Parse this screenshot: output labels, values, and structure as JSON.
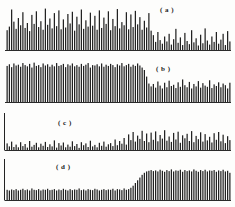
{
  "figure": {
    "background_color": "#fdfdfc",
    "bar_color": "#222222",
    "axis_color": "#222222",
    "label_a": "( a )",
    "label_b": "( b )",
    "label_c": "( c )",
    "label_d": "( d )"
  },
  "chart_data": [
    {
      "type": "bar",
      "title": "( a )",
      "xlabel": "",
      "ylabel": "",
      "grid": false,
      "legend": "none",
      "ylim": [
        0,
        100
      ],
      "axis": {
        "y_axis_visible": false,
        "baseline_visible": true
      },
      "categories": [
        "1",
        "2",
        "3",
        "4",
        "5",
        "6",
        "7",
        "8",
        "9",
        "10",
        "11",
        "12",
        "13",
        "14",
        "15",
        "16",
        "17",
        "18",
        "19",
        "20",
        "21",
        "22",
        "23",
        "24",
        "25",
        "26",
        "27",
        "28",
        "29",
        "30",
        "31",
        "32",
        "33",
        "34",
        "35",
        "36",
        "37",
        "38",
        "39",
        "40",
        "41",
        "42",
        "43",
        "44",
        "45",
        "46",
        "47",
        "48",
        "49",
        "50",
        "51",
        "52",
        "53",
        "54",
        "55",
        "56",
        "57",
        "58",
        "59",
        "60",
        "61",
        "62",
        "63",
        "64",
        "65",
        "66",
        "67",
        "68",
        "69",
        "70",
        "71",
        "72",
        "73",
        "74",
        "75",
        "76",
        "77",
        "78",
        "79",
        "80",
        "81",
        "82",
        "83",
        "84",
        "85",
        "86",
        "87",
        "88",
        "89",
        "90",
        "91",
        "92",
        "93",
        "94",
        "95",
        "96",
        "97",
        "98",
        "99",
        "100"
      ],
      "values": [
        44,
        52,
        90,
        63,
        47,
        71,
        55,
        84,
        49,
        60,
        42,
        78,
        58,
        86,
        51,
        64,
        45,
        92,
        56,
        70,
        48,
        82,
        53,
        88,
        46,
        68,
        50,
        80,
        59,
        85,
        43,
        74,
        57,
        90,
        47,
        66,
        52,
        83,
        54,
        76,
        45,
        88,
        49,
        72,
        58,
        86,
        44,
        69,
        53,
        91,
        48,
        62,
        55,
        84,
        46,
        79,
        51,
        87,
        57,
        73,
        45,
        65,
        50,
        82,
        43,
        33,
        18,
        40,
        22,
        14,
        30,
        19,
        36,
        12,
        24,
        47,
        16,
        28,
        11,
        38,
        20,
        13,
        44,
        17,
        26,
        10,
        34,
        15,
        48,
        21,
        12,
        30,
        18,
        40,
        14,
        23,
        36,
        11,
        42,
        19
      ]
    },
    {
      "type": "bar",
      "title": "( b )",
      "xlabel": "",
      "ylabel": "",
      "grid": false,
      "legend": "none",
      "ylim": [
        0,
        100
      ],
      "axis": {
        "y_axis_visible": false,
        "baseline_visible": true
      },
      "categories": [
        "1",
        "2",
        "3",
        "4",
        "5",
        "6",
        "7",
        "8",
        "9",
        "10",
        "11",
        "12",
        "13",
        "14",
        "15",
        "16",
        "17",
        "18",
        "19",
        "20",
        "21",
        "22",
        "23",
        "24",
        "25",
        "26",
        "27",
        "28",
        "29",
        "30",
        "31",
        "32",
        "33",
        "34",
        "35",
        "36",
        "37",
        "38",
        "39",
        "40",
        "41",
        "42",
        "43",
        "44",
        "45",
        "46",
        "47",
        "48",
        "49",
        "50",
        "51",
        "52",
        "53",
        "54",
        "55",
        "56",
        "57",
        "58",
        "59",
        "60",
        "61",
        "62",
        "63",
        "64",
        "65",
        "66",
        "67",
        "68",
        "69",
        "70",
        "71",
        "72",
        "73",
        "74",
        "75",
        "76",
        "77",
        "78",
        "79",
        "80",
        "81",
        "82",
        "83",
        "84",
        "85",
        "86",
        "87",
        "88",
        "89",
        "90",
        "91",
        "92",
        "93",
        "94",
        "95",
        "96",
        "97",
        "98",
        "99",
        "100"
      ],
      "values": [
        88,
        92,
        85,
        94,
        89,
        91,
        86,
        95,
        90,
        87,
        93,
        84,
        96,
        88,
        90,
        85,
        94,
        89,
        92,
        86,
        91,
        87,
        95,
        88,
        90,
        93,
        85,
        92,
        89,
        94,
        87,
        90,
        86,
        93,
        88,
        91,
        95,
        84,
        90,
        89,
        92,
        87,
        94,
        86,
        91,
        88,
        93,
        90,
        85,
        92,
        89,
        95,
        87,
        90,
        93,
        86,
        91,
        88,
        94,
        89,
        84,
        78,
        62,
        45,
        38,
        44,
        35,
        50,
        40,
        33,
        47,
        36,
        52,
        39,
        42,
        34,
        48,
        37,
        55,
        41,
        36,
        49,
        33,
        44,
        38,
        51,
        35,
        46,
        40,
        37,
        53,
        34,
        43,
        39,
        48,
        36,
        45,
        41,
        33,
        47
      ]
    },
    {
      "type": "bar",
      "title": "( c )",
      "xlabel": "",
      "ylabel": "",
      "grid": false,
      "legend": "none",
      "ylim": [
        0,
        100
      ],
      "axis": {
        "y_axis_visible": true,
        "baseline_visible": true
      },
      "categories": [
        "1",
        "2",
        "3",
        "4",
        "5",
        "6",
        "7",
        "8",
        "9",
        "10",
        "11",
        "12",
        "13",
        "14",
        "15",
        "16",
        "17",
        "18",
        "19",
        "20",
        "21",
        "22",
        "23",
        "24",
        "25",
        "26",
        "27",
        "28",
        "29",
        "30",
        "31",
        "32",
        "33",
        "34",
        "35",
        "36",
        "37",
        "38",
        "39",
        "40",
        "41",
        "42",
        "43",
        "44",
        "45",
        "46",
        "47",
        "48",
        "49",
        "50",
        "51",
        "52",
        "53",
        "54",
        "55",
        "56",
        "57",
        "58",
        "59",
        "60",
        "61",
        "62",
        "63",
        "64",
        "65",
        "66",
        "67",
        "68",
        "69",
        "70",
        "71",
        "72",
        "73",
        "74",
        "75",
        "76",
        "77",
        "78",
        "79",
        "80",
        "81",
        "82",
        "83",
        "84",
        "85",
        "86",
        "87",
        "88",
        "89",
        "90",
        "91",
        "92",
        "93",
        "94",
        "95",
        "96",
        "97",
        "98",
        "99",
        "100"
      ],
      "values": [
        22,
        12,
        28,
        10,
        18,
        9,
        26,
        13,
        20,
        8,
        30,
        11,
        17,
        24,
        9,
        21,
        14,
        27,
        10,
        19,
        12,
        32,
        8,
        23,
        15,
        25,
        9,
        18,
        11,
        29,
        13,
        20,
        7,
        26,
        16,
        22,
        10,
        31,
        12,
        17,
        9,
        24,
        14,
        28,
        11,
        19,
        23,
        13,
        35,
        16,
        30,
        21,
        40,
        18,
        52,
        33,
        60,
        28,
        48,
        37,
        64,
        30,
        55,
        26,
        58,
        34,
        62,
        29,
        50,
        38,
        66,
        31,
        45,
        27,
        57,
        35,
        61,
        24,
        49,
        39,
        54,
        30,
        63,
        26,
        47,
        36,
        59,
        28,
        53,
        32,
        44,
        25,
        56,
        34,
        60,
        29,
        51,
        23,
        46,
        33
      ]
    },
    {
      "type": "bar",
      "title": "( d )",
      "xlabel": "",
      "ylabel": "",
      "grid": false,
      "legend": "none",
      "ylim": [
        0,
        100
      ],
      "axis": {
        "y_axis_visible": true,
        "baseline_visible": true
      },
      "categories": [
        "1",
        "2",
        "3",
        "4",
        "5",
        "6",
        "7",
        "8",
        "9",
        "10",
        "11",
        "12",
        "13",
        "14",
        "15",
        "16",
        "17",
        "18",
        "19",
        "20",
        "21",
        "22",
        "23",
        "24",
        "25",
        "26",
        "27",
        "28",
        "29",
        "30",
        "31",
        "32",
        "33",
        "34",
        "35",
        "36",
        "37",
        "38",
        "39",
        "40",
        "41",
        "42",
        "43",
        "44",
        "45",
        "46",
        "47",
        "48",
        "49",
        "50",
        "51",
        "52",
        "53",
        "54",
        "55",
        "56",
        "57",
        "58",
        "59",
        "60",
        "61",
        "62",
        "63",
        "64",
        "65",
        "66",
        "67",
        "68",
        "69",
        "70",
        "71",
        "72",
        "73",
        "74",
        "75",
        "76",
        "77",
        "78",
        "79",
        "80",
        "81",
        "82",
        "83",
        "84",
        "85",
        "86",
        "87",
        "88",
        "89",
        "90",
        "91",
        "92",
        "93",
        "94",
        "95",
        "96",
        "97",
        "98",
        "99",
        "100"
      ],
      "values": [
        30,
        28,
        31,
        29,
        32,
        28,
        30,
        33,
        29,
        31,
        28,
        34,
        30,
        29,
        32,
        28,
        31,
        30,
        33,
        29,
        30,
        32,
        28,
        31,
        29,
        33,
        30,
        28,
        32,
        29,
        31,
        30,
        34,
        29,
        31,
        28,
        32,
        30,
        29,
        33,
        31,
        28,
        30,
        32,
        29,
        31,
        30,
        33,
        28,
        32,
        31,
        29,
        34,
        30,
        32,
        36,
        42,
        50,
        58,
        66,
        74,
        80,
        84,
        86,
        88,
        85,
        87,
        84,
        89,
        86,
        83,
        88,
        85,
        90,
        84,
        87,
        86,
        89,
        83,
        88,
        85,
        87,
        84,
        90,
        86,
        83,
        88,
        85,
        89,
        84,
        87,
        86,
        88,
        83,
        87,
        85,
        89,
        84,
        86,
        80
      ]
    }
  ]
}
